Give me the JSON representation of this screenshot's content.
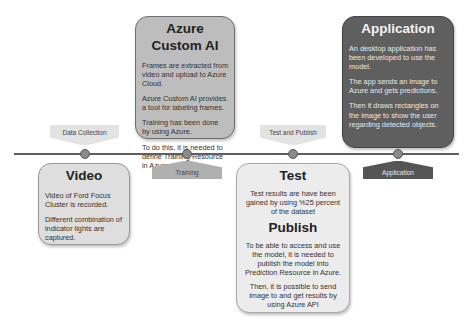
{
  "timeline": {
    "stages": [
      {
        "label": "Data Collection",
        "position": "above"
      },
      {
        "label": "Training",
        "position": "below"
      },
      {
        "label": "Test and Publish",
        "position": "above"
      },
      {
        "label": "Application",
        "position": "below"
      }
    ]
  },
  "boxes": {
    "azure": {
      "title": "Azure Custom AI",
      "paragraphs": [
        "Frames are extracted from video and upload to Azure Cloud.",
        "Azure Custom AI provides a tool for labeling frames.",
        "Training has been done by using Azure.",
        "To do this, it is needed to define Training Resource in Azure"
      ]
    },
    "application": {
      "title": "Application",
      "paragraphs": [
        "An desktop application has been developed to use the model.",
        "The app sends an image to Azure and gets predictions.",
        "Then it draws rectangles on the image to show the user regarding detected objects."
      ]
    },
    "video": {
      "title": "Video",
      "paragraphs": [
        "Video of Ford Focus Cluster is recorded.",
        "Different combination of indicator lights are captured."
      ]
    },
    "test": {
      "title": "Test",
      "paragraphs": [
        "Test results are have been gained by using %25 percent of the dataset"
      ],
      "publish_title": "Publish",
      "publish_paragraphs": [
        "To be able to access and use the model, it is needed to publish the model into Prediction Resource in Azure.",
        "Then, it is possible to send image to and get results by using Azure API"
      ]
    }
  },
  "colors": {
    "azure_box": "#bdbdbd",
    "application_box": "#5f5f5f",
    "video_box": "#dedede",
    "test_box": "#ececec",
    "timeline": "#5e5e5e",
    "marker": "#8a8a8a"
  }
}
